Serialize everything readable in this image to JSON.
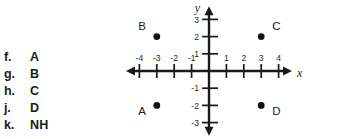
{
  "question": {
    "choices": [
      {
        "key": "f.",
        "label": "A"
      },
      {
        "key": "g.",
        "label": "B"
      },
      {
        "key": "h.",
        "label": "C"
      },
      {
        "key": "j.",
        "label": "D"
      },
      {
        "key": "k.",
        "label": "NH"
      }
    ]
  },
  "chart_data": {
    "type": "scatter",
    "title": "",
    "xlabel": "x",
    "ylabel": "y",
    "xlim": [
      -5,
      5
    ],
    "ylim": [
      -4,
      4
    ],
    "xticks": [
      -4,
      -3,
      -2,
      -1,
      1,
      2,
      3,
      4
    ],
    "yticks": [
      3,
      2,
      1,
      -1,
      -2,
      -3
    ],
    "xtick_labels": [
      "-4",
      "-3",
      "-2",
      "-1",
      "1",
      "2",
      "3",
      "4"
    ],
    "ytick_labels": [
      "3",
      "2",
      "1",
      "-1",
      "-2",
      "-3"
    ],
    "grid": false,
    "legend": "none",
    "points": [
      {
        "name": "B",
        "x": -3,
        "y": 2,
        "label_pos": "upper-left"
      },
      {
        "name": "C",
        "x": 3,
        "y": 2,
        "label_pos": "upper-right"
      },
      {
        "name": "A",
        "x": -3,
        "y": -2,
        "label_pos": "lower-left"
      },
      {
        "name": "D",
        "x": 3,
        "y": -2,
        "label_pos": "lower-right"
      }
    ]
  },
  "colors": {
    "ink": "#1a1a1a",
    "background": "#ffffff"
  }
}
